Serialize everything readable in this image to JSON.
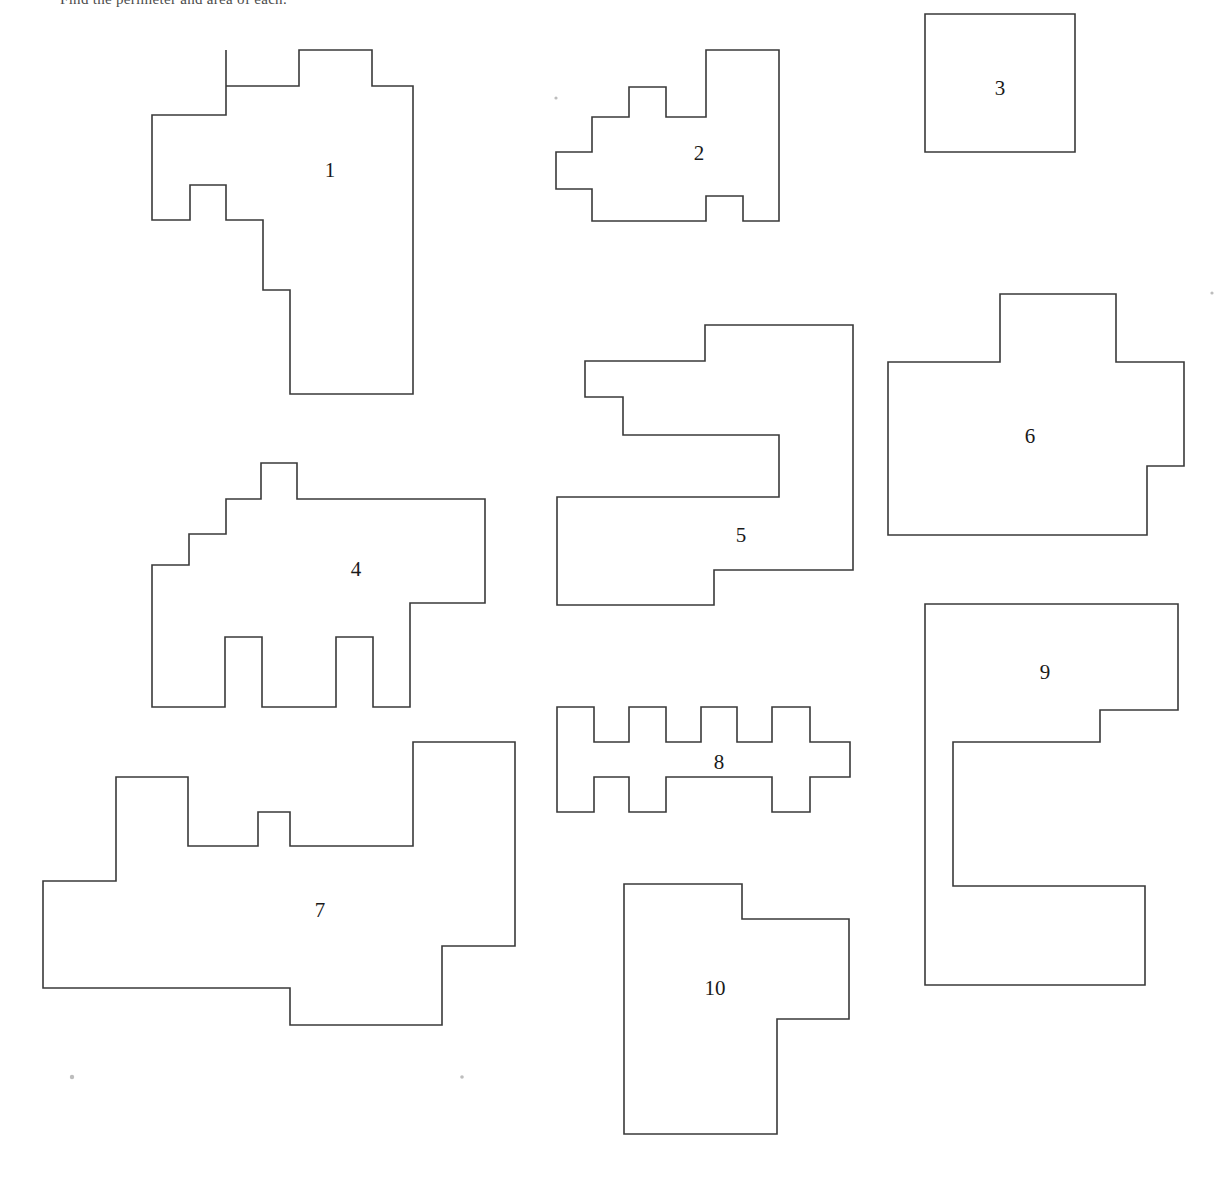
{
  "page": {
    "width": 1227,
    "height": 1191,
    "background_color": "#ffffff",
    "stroke_color": "#3a3a3a",
    "label_color": "#1a1a1a",
    "header_text": "Find the perimeter and area of each."
  },
  "shapes": [
    {
      "id": "shape-1",
      "label": "1",
      "label_x": 330,
      "label_y": 172,
      "points": "226,50 226,86 299,86 299,50 372,50 372,86 413,86 413,394 290,394 290,290 263,290 263,220 226,220 226,185 190,185 190,220 152,220 152,115 226,115"
    },
    {
      "id": "shape-2",
      "label": "2",
      "label_x": 699,
      "label_y": 155,
      "points": "629,87 629,117 592,117 592,152 556,152 556,189 592,189 592,221 706,221 706,196 743,196 743,221 779,221 779,50 706,50 706,117 666,117 666,87"
    },
    {
      "id": "shape-3",
      "label": "3",
      "label_x": 1000,
      "label_y": 90,
      "points": "925,14 1075,14 1075,152 925,152"
    },
    {
      "id": "shape-4",
      "label": "4",
      "label_x": 356,
      "label_y": 571,
      "points": "261,463 297,463 297,499 485,499 485,603 410,603 410,707 373,707 373,637 336,637 336,707 262,707 262,637 225,637 225,707 152,707 152,565 189,565 189,534 226,534 226,499 261,499"
    },
    {
      "id": "shape-5",
      "label": "5",
      "label_x": 741,
      "label_y": 537,
      "points": "705,325 853,325 853,570 714,570 714,605 557,605 557,497 779,497 779,435 623,435 623,397 585,397 585,361 705,361"
    },
    {
      "id": "shape-6",
      "label": "6",
      "label_x": 1030,
      "label_y": 438,
      "points": "1000,294 1116,294 1116,362 1184,362 1184,466 1147,466 1147,535 888,535 888,362 1000,362"
    },
    {
      "id": "shape-7",
      "label": "7",
      "label_x": 320,
      "label_y": 912,
      "points": "413,742 515,742 515,946 442,946 442,1025 290,1025 290,988 43,988 43,881 116,881 116,777 188,777 188,846 258,846 258,812 290,812 290,846 413,846"
    },
    {
      "id": "shape-8",
      "label": "8",
      "label_x": 719,
      "label_y": 764,
      "points": "557,707 594,707 594,742 629,742 629,707 666,707 666,742 701,742 701,707 737,707 737,742 772,742 772,707 810,707 810,742 850,742 850,777 810,777 810,812 772,812 772,777 666,777 666,812 629,812 629,777 594,777 594,812 557,812"
    },
    {
      "id": "shape-9",
      "label": "9",
      "label_x": 1045,
      "label_y": 674,
      "points": "925,604 1178,604 1178,710 1100,710 1100,742 953,742 953,886 1145,886 1145,985 925,985"
    },
    {
      "id": "shape-10",
      "label": "10",
      "label_x": 715,
      "label_y": 990,
      "points": "624,884 742,884 742,919 849,919 849,1019 777,1019 777,1134 624,1134"
    }
  ],
  "specks": [
    {
      "x": 72,
      "y": 1077,
      "r": 2.2
    },
    {
      "x": 462,
      "y": 1077,
      "r": 1.8
    },
    {
      "x": 556,
      "y": 98,
      "r": 1.6
    },
    {
      "x": 1212,
      "y": 293,
      "r": 1.6
    }
  ]
}
